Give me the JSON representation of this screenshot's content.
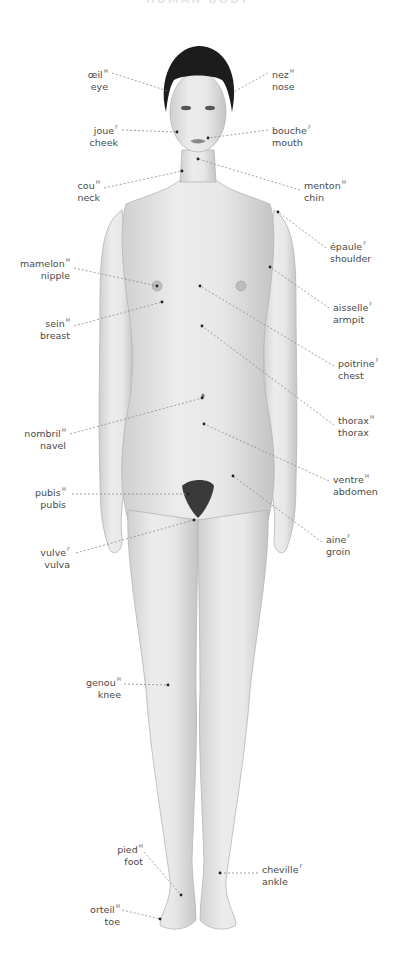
{
  "title": "HUMAN BODY",
  "figure": {
    "skin_color": "#e2e2e2",
    "shade_color": "#c8c8c8",
    "hair_color": "#1c1c1c",
    "leader_color": "#8a8a8a"
  },
  "labels": [
    {
      "id": "eye",
      "fr": "œil",
      "gender": "M",
      "en": "eye",
      "side": "left",
      "x": 108,
      "y": 65,
      "tx": 168,
      "ty": 91,
      "lx": 112,
      "ly": 73
    },
    {
      "id": "nose",
      "fr": "nez",
      "gender": "M",
      "en": "nose",
      "side": "right",
      "x": 272,
      "y": 65,
      "tx": 232,
      "ty": 93,
      "lx": 268,
      "ly": 73
    },
    {
      "id": "cheek",
      "fr": "joue",
      "gender": "F",
      "en": "cheek",
      "side": "left",
      "x": 118,
      "y": 121,
      "tx": 177,
      "ty": 132,
      "lx": 122,
      "ly": 130
    },
    {
      "id": "mouth",
      "fr": "bouche",
      "gender": "F",
      "en": "mouth",
      "side": "right",
      "x": 272,
      "y": 121,
      "tx": 208,
      "ty": 138,
      "lx": 268,
      "ly": 130
    },
    {
      "id": "neck",
      "fr": "cou",
      "gender": "M",
      "en": "neck",
      "side": "left",
      "x": 100,
      "y": 176,
      "tx": 182,
      "ty": 171,
      "lx": 104,
      "ly": 188
    },
    {
      "id": "chin",
      "fr": "menton",
      "gender": "M",
      "en": "chin",
      "side": "right",
      "x": 304,
      "y": 176,
      "tx": 198,
      "ty": 159,
      "lx": 300,
      "ly": 190
    },
    {
      "id": "shoulder",
      "fr": "épaule",
      "gender": "F",
      "en": "shoulder",
      "side": "right",
      "x": 330,
      "y": 237,
      "tx": 278,
      "ty": 212,
      "lx": 326,
      "ly": 248
    },
    {
      "id": "nipple",
      "fr": "mamelon",
      "gender": "M",
      "en": "nipple",
      "side": "left",
      "x": 70,
      "y": 254,
      "tx": 157,
      "ty": 286,
      "lx": 74,
      "ly": 268
    },
    {
      "id": "breast",
      "fr": "sein",
      "gender": "M",
      "en": "breast",
      "side": "left",
      "x": 70,
      "y": 314,
      "tx": 162,
      "ty": 302,
      "lx": 74,
      "ly": 326
    },
    {
      "id": "armpit",
      "fr": "aisselle",
      "gender": "F",
      "en": "armpit",
      "side": "right",
      "x": 333,
      "y": 298,
      "tx": 270,
      "ty": 267,
      "lx": 329,
      "ly": 308
    },
    {
      "id": "chest",
      "fr": "poitrine",
      "gender": "F",
      "en": "chest",
      "side": "right",
      "x": 338,
      "y": 354,
      "tx": 200,
      "ty": 286,
      "lx": 334,
      "ly": 366
    },
    {
      "id": "thorax",
      "fr": "thorax",
      "gender": "M",
      "en": "thorax",
      "side": "right",
      "x": 338,
      "y": 411,
      "tx": 202,
      "ty": 326,
      "lx": 334,
      "ly": 425
    },
    {
      "id": "navel",
      "fr": "nombril",
      "gender": "M",
      "en": "navel",
      "side": "left",
      "x": 66,
      "y": 424,
      "tx": 202,
      "ty": 398,
      "lx": 70,
      "ly": 434
    },
    {
      "id": "abdomen",
      "fr": "ventre",
      "gender": "M",
      "en": "abdomen",
      "side": "right",
      "x": 333,
      "y": 470,
      "tx": 204,
      "ty": 424,
      "lx": 329,
      "ly": 481
    },
    {
      "id": "pubis",
      "fr": "pubis",
      "gender": "M",
      "en": "pubis",
      "side": "left",
      "x": 66,
      "y": 483,
      "tx": 188,
      "ty": 494,
      "lx": 72,
      "ly": 494
    },
    {
      "id": "groin",
      "fr": "aine",
      "gender": "F",
      "en": "groin",
      "side": "right",
      "x": 326,
      "y": 530,
      "tx": 233,
      "ty": 476,
      "lx": 322,
      "ly": 542
    },
    {
      "id": "vulva",
      "fr": "vulve",
      "gender": "F",
      "en": "vulva",
      "side": "left",
      "x": 70,
      "y": 543,
      "tx": 194,
      "ty": 520,
      "lx": 76,
      "ly": 553
    },
    {
      "id": "knee",
      "fr": "genou",
      "gender": "M",
      "en": "knee",
      "side": "left",
      "x": 121,
      "y": 673,
      "tx": 168,
      "ty": 685,
      "lx": 124,
      "ly": 684
    },
    {
      "id": "foot",
      "fr": "pied",
      "gender": "M",
      "en": "foot",
      "side": "left",
      "x": 143,
      "y": 840,
      "tx": 181,
      "ty": 895,
      "lx": 144,
      "ly": 852
    },
    {
      "id": "ankle",
      "fr": "cheville",
      "gender": "F",
      "en": "ankle",
      "side": "right",
      "x": 262,
      "y": 860,
      "tx": 220,
      "ty": 873,
      "lx": 258,
      "ly": 873
    },
    {
      "id": "toe",
      "fr": "orteil",
      "gender": "M",
      "en": "toe",
      "side": "left",
      "x": 120,
      "y": 900,
      "tx": 160,
      "ty": 919,
      "lx": 122,
      "ly": 910
    }
  ]
}
